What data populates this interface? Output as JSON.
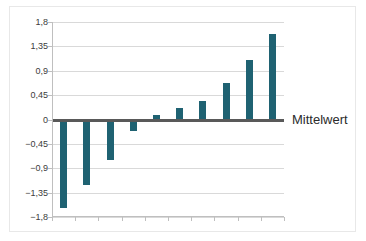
{
  "figure": {
    "series_label": "Mittelwert"
  },
  "chart_data": {
    "type": "bar",
    "title": "",
    "xlabel": "",
    "ylabel": "",
    "categories": [
      "1",
      "2",
      "3",
      "4",
      "5",
      "6",
      "7",
      "8",
      "9",
      "10"
    ],
    "series": [
      {
        "name": "Mittelwert",
        "values": [
          -1.62,
          -1.2,
          -0.73,
          -0.21,
          0.08,
          0.22,
          0.34,
          0.67,
          1.1,
          1.58
        ],
        "color": "#1f6272"
      }
    ],
    "ylim": [
      -1.8,
      1.8
    ],
    "yticks": [
      1.8,
      1.35,
      0.9,
      0.45,
      0,
      -0.45,
      -0.9,
      -1.35,
      -1.8
    ],
    "ytick_labels": [
      "1,8",
      "1,35",
      "0,9",
      "0,45",
      "0",
      "-0,45",
      "-0,9",
      "-1,35",
      "-1,8"
    ],
    "grid": true,
    "legend_position": "right-of-zero-line",
    "zero_line_color": "#595959",
    "grid_color": "#d9d9d9"
  }
}
